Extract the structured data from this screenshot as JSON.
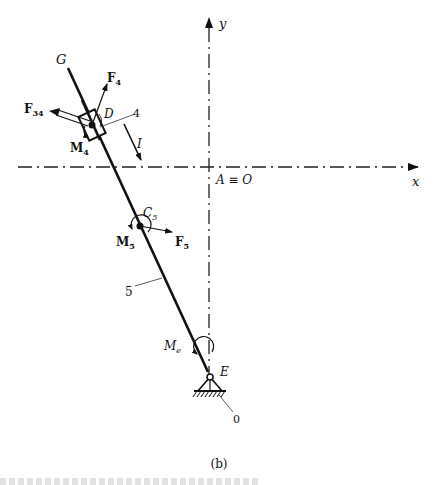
{
  "figure": {
    "caption": "(b)",
    "axes": {
      "x_label": "x",
      "y_label": "y",
      "origin_label": "A ≡ O",
      "origin": [
        209,
        167
      ],
      "style": "dash-dot"
    },
    "points": {
      "G": {
        "label": "G",
        "pos": [
          68,
          68
        ]
      },
      "D": {
        "label": "D",
        "pos": [
          92,
          125
        ]
      },
      "C5": {
        "label": "C",
        "sub": "5",
        "pos": [
          140,
          226
        ]
      },
      "E": {
        "label": "E",
        "pos": [
          210,
          377
        ]
      }
    },
    "link": {
      "from": "G",
      "to": "E",
      "label": "5"
    },
    "slider": {
      "label": "4",
      "at": "D"
    },
    "ground": {
      "label": "0",
      "at": "E"
    },
    "direction_arrow": {
      "label": "I"
    },
    "forces": [
      {
        "id": "F4",
        "label": "F",
        "sub": "4",
        "from": [
          92,
          125
        ],
        "to": [
          107,
          84
        ]
      },
      {
        "id": "F34",
        "label": "F",
        "sub": "34",
        "from": [
          92,
          125
        ],
        "to": [
          55,
          112
        ]
      },
      {
        "id": "F5",
        "label": "F",
        "sub": "5",
        "from": [
          140,
          226
        ],
        "to": [
          172,
          232
        ]
      }
    ],
    "moments": [
      {
        "id": "M4",
        "label": "M",
        "sub": "4"
      },
      {
        "id": "M5",
        "label": "M",
        "sub": "5"
      },
      {
        "id": "Me",
        "label": "M",
        "sub": "e"
      }
    ],
    "colors": {
      "ink": "#111111",
      "axis": "#222222",
      "background": "#ffffff"
    }
  }
}
